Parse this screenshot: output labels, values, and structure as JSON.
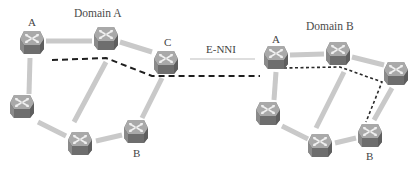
{
  "colors": {
    "link": "#c8c8c8",
    "path": "#1a1a1a",
    "enni": "#b8b8b8",
    "router_top": "#b0b0b0",
    "router_side": "#6a6a6a",
    "router_front": "#808080",
    "arrow": "#f2f2f2"
  },
  "labels": {
    "domain_a": "Domain A",
    "domain_b": "Domain B",
    "enni": "E-NNI",
    "a_node_a": "A",
    "a_node_b": "B",
    "a_node_c": "C",
    "b_node_a": "A",
    "b_node_b": "B"
  },
  "domains": [
    {
      "name": "Domain A",
      "nodes": [
        {
          "id": "A",
          "x": 32,
          "y": 42,
          "label": "A"
        },
        {
          "id": "T",
          "x": 106,
          "y": 38,
          "label": ""
        },
        {
          "id": "C",
          "x": 166,
          "y": 60,
          "label": "C"
        },
        {
          "id": "L",
          "x": 22,
          "y": 106,
          "label": ""
        },
        {
          "id": "M",
          "x": 80,
          "y": 142,
          "label": ""
        },
        {
          "id": "B",
          "x": 136,
          "y": 132,
          "label": "B"
        }
      ],
      "links": [
        [
          "A",
          "T"
        ],
        [
          "T",
          "C"
        ],
        [
          "A",
          "L"
        ],
        [
          "L",
          "M"
        ],
        [
          "M",
          "B"
        ],
        [
          "T",
          "M"
        ],
        [
          "C",
          "B"
        ]
      ]
    },
    {
      "name": "Domain B",
      "nodes": [
        {
          "id": "A",
          "x": 276,
          "y": 56,
          "label": "A"
        },
        {
          "id": "T",
          "x": 338,
          "y": 52,
          "label": ""
        },
        {
          "id": "R",
          "x": 396,
          "y": 72,
          "label": ""
        },
        {
          "id": "L",
          "x": 268,
          "y": 112,
          "label": ""
        },
        {
          "id": "M",
          "x": 320,
          "y": 144,
          "label": ""
        },
        {
          "id": "B",
          "x": 370,
          "y": 134,
          "label": "B"
        }
      ],
      "links": [
        [
          "A",
          "T"
        ],
        [
          "T",
          "R"
        ],
        [
          "A",
          "L"
        ],
        [
          "L",
          "M"
        ],
        [
          "M",
          "B"
        ],
        [
          "T",
          "M"
        ],
        [
          "R",
          "B"
        ]
      ]
    }
  ],
  "path": {
    "domain_a_segment": "A → T → C (long dashed)",
    "inter_domain_segment": "C → A (long dashed, across E-NNI)",
    "domain_b_segment": "A → T → R → B (short dotted)"
  }
}
